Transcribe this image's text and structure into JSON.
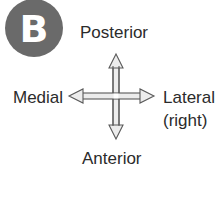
{
  "panel": {
    "badge_letter": "B",
    "badge_color": "#6a6a6a"
  },
  "directions": {
    "up": "Posterior",
    "down": "Anterior",
    "left": "Medial",
    "right_line1": "Lateral",
    "right_line2": "(right)"
  },
  "arrow": {
    "fill_color": "#e8e8e8",
    "stroke_color": "#555555",
    "icon": "four-way-arrow-icon"
  }
}
